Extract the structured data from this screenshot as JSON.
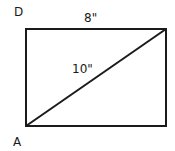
{
  "diagram": {
    "shape": "rectangle-with-diagonal",
    "vertices": {
      "top_left": "D",
      "bottom_left": "A"
    },
    "labels": {
      "top_side": "8\"",
      "diagonal": "10\""
    },
    "stroke_color": "#1a1a1a"
  }
}
